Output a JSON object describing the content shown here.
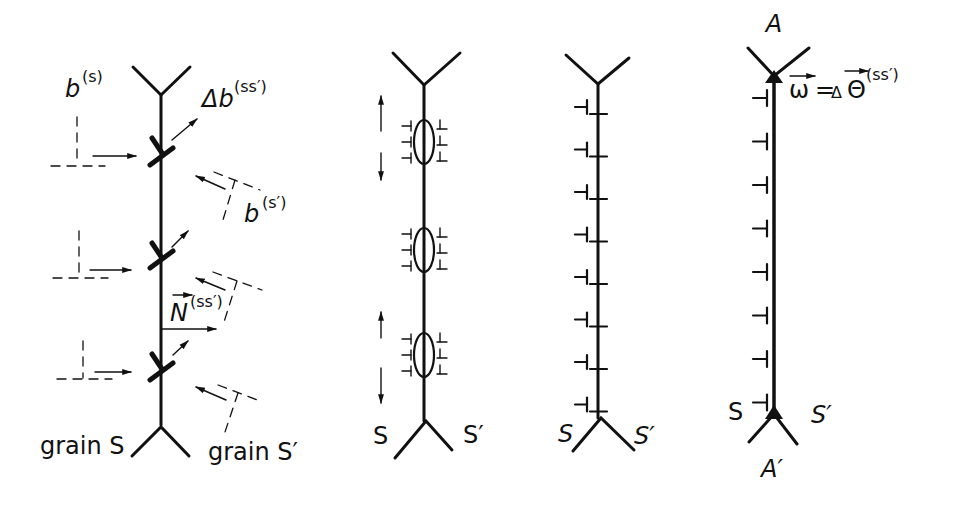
{
  "panels": [
    {
      "id": "panel-1",
      "labels": {
        "b_s": "b",
        "b_s_sup": "(s)",
        "delta_b": "Δb",
        "delta_b_sup": "(ss′)",
        "b_s_prime": "b",
        "b_s_prime_sup": "(s′)",
        "normal": "N",
        "normal_sup": "(ss′)",
        "grain_left": "grain S",
        "grain_right": "grain S′"
      },
      "dislocation_count": 3
    },
    {
      "id": "panel-2",
      "labels": {
        "left": "S",
        "right": "S′"
      },
      "cluster_count": 3,
      "dislocations_per_side": 3
    },
    {
      "id": "panel-3",
      "labels": {
        "left": "S",
        "right": "S′"
      },
      "dislocation_count": 8
    },
    {
      "id": "panel-4",
      "labels": {
        "top": "A",
        "bottom": "A′",
        "left": "S",
        "right": "S′",
        "omega": "ω",
        "equals": "=",
        "delta_theta": "Δ",
        "theta": "Θ",
        "theta_sup": "(ss′)"
      },
      "dislocation_count": 8
    }
  ],
  "colors": {
    "ink": "#111111",
    "background": "#ffffff"
  }
}
